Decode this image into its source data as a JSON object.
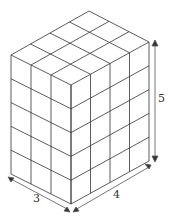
{
  "diagram": {
    "type": "rectangular prism made of unit cubes",
    "dimensions": {
      "width": 3,
      "depth": 4,
      "height": 5
    },
    "labels": {
      "width": "3",
      "depth": "4",
      "height": "5"
    },
    "colors": {
      "line": "#333333",
      "background": "#ffffff"
    }
  }
}
